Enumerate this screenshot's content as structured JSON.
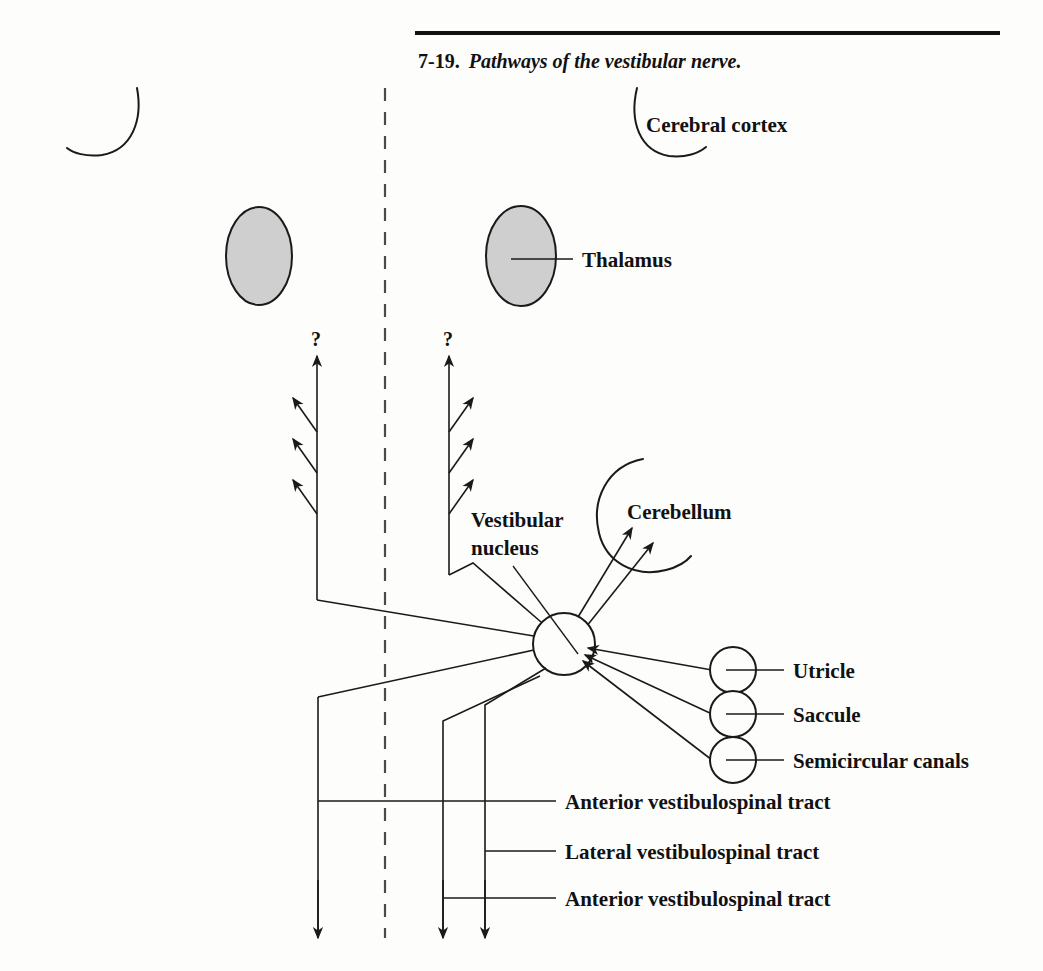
{
  "figure": {
    "number": "7-19.",
    "caption": "Pathways of the vestibular nerve.",
    "rule_color": "#111111",
    "ink_color": "#1a1a1a",
    "background_color": "#fdfdfc",
    "shade_color": "#cfcfcf"
  },
  "labels": {
    "cerebral_cortex": "Cerebral cortex",
    "thalamus": "Thalamus",
    "vestibular_nucleus_line1": "Vestibular",
    "vestibular_nucleus_line2": "nucleus",
    "cerebellum": "Cerebellum",
    "utricle": "Utricle",
    "saccule": "Saccule",
    "semicircular_canals": "Semicircular canals",
    "anterior_tract_upper": "Anterior vestibulospinal tract",
    "lateral_tract": "Lateral vestibulospinal tract",
    "anterior_tract_lower": "Anterior vestibulospinal tract",
    "question_left": "?",
    "question_right": "?"
  },
  "structures": {
    "midline": "dashed-midline",
    "nucleus": "vestibular-nucleus-circle",
    "organs": [
      "utricle-circle",
      "saccule-circle",
      "semicircular-canals-circle"
    ],
    "thalami": [
      "thalamus-left-ellipse",
      "thalamus-right-ellipse"
    ],
    "cortex_arcs": [
      "cerebral-cortex-arc-left",
      "cerebral-cortex-arc-right"
    ],
    "cerebellum_arc": "cerebellum-arc",
    "ascending_tracts": 2,
    "ascending_branches_per_tract": 3,
    "descending_tracts": 3
  }
}
